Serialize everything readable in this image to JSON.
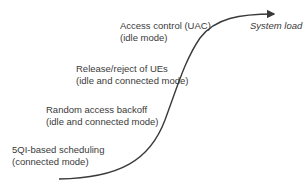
{
  "diagram": {
    "axis_label": "System load",
    "curve_color": "#3a3a3a",
    "stages": [
      {
        "line1": "Access control (UAC)",
        "line2": "(idle mode)"
      },
      {
        "line1": "Release/reject of UEs",
        "line2": "(idle and connected mode)"
      },
      {
        "line1": "Random access backoff",
        "line2": "(idle and connected mode)"
      },
      {
        "line1": "5QI-based scheduling",
        "line2": "(connected mode)"
      }
    ]
  }
}
